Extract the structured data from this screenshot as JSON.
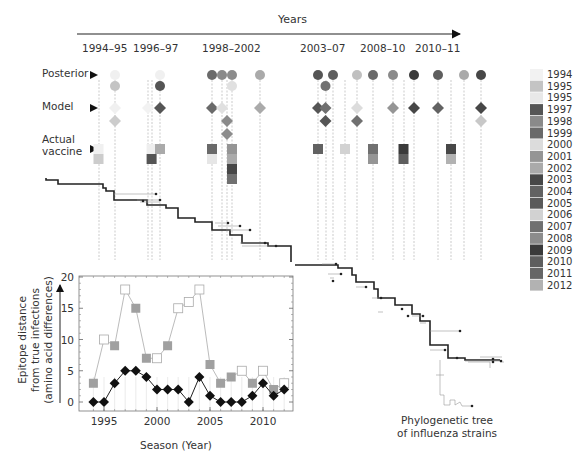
{
  "figure": {
    "years_label": "Years",
    "periods": [
      "1994–95",
      "1996–97",
      "1998–2002",
      "2003–07",
      "2008–10",
      "2010–11"
    ],
    "row_labels": {
      "posterior": "Posterior",
      "model": "Model",
      "actual1": "Actual",
      "actual2": "vaccine"
    },
    "tree_label1": "Phylogenetic tree",
    "tree_label2": "of influenza strains",
    "legend": [
      {
        "year": "1994",
        "color": "#f2f2f2"
      },
      {
        "year": "1995",
        "color": "#c4c4c4"
      },
      {
        "year": "1995",
        "color": "#e8e8e8"
      },
      {
        "year": "1997",
        "color": "#555555"
      },
      {
        "year": "1998",
        "color": "#8a8a8a"
      },
      {
        "year": "1999",
        "color": "#6a6a6a"
      },
      {
        "year": "2000",
        "color": "#dcdcdc"
      },
      {
        "year": "2001",
        "color": "#959595"
      },
      {
        "year": "2002",
        "color": "#aaaaaa"
      },
      {
        "year": "2003",
        "color": "#474747"
      },
      {
        "year": "2004",
        "color": "#626262"
      },
      {
        "year": "2005",
        "color": "#5a5a5a"
      },
      {
        "year": "2006",
        "color": "#d2d2d2"
      },
      {
        "year": "2007",
        "color": "#707070"
      },
      {
        "year": "2008",
        "color": "#8c8c8c"
      },
      {
        "year": "2009",
        "color": "#3a3a3a"
      },
      {
        "year": "2010",
        "color": "#5e5e5e"
      },
      {
        "year": "2011",
        "color": "#666666"
      },
      {
        "year": "2012",
        "color": "#b2b2b2"
      }
    ],
    "posterior_markers": [
      {
        "col": 0,
        "tier": 0,
        "color": "#f0f0f0"
      },
      {
        "col": 0,
        "tier": 1,
        "color": "#c4c4c4"
      },
      {
        "col": 2,
        "tier": 0,
        "color": "#f0f0f0"
      },
      {
        "col": 2,
        "tier": 1,
        "color": "#555555"
      },
      {
        "col": 3,
        "tier": 0,
        "color": "#6a6a6a"
      },
      {
        "col": 4,
        "tier": 0,
        "color": "#8a8a8a"
      },
      {
        "col": 5,
        "tier": 0,
        "color": "#8c8c8c"
      },
      {
        "col": 5,
        "tier": 1,
        "color": "#e0e0e0"
      },
      {
        "col": 6,
        "tier": 0,
        "color": "#aaaaaa"
      },
      {
        "col": 7,
        "tier": 0,
        "color": "#555555"
      },
      {
        "col": 8,
        "tier": 0,
        "color": "#5e5e5e"
      },
      {
        "col": 7.5,
        "tier": 1,
        "color": "#707070"
      },
      {
        "col": 9,
        "tier": 0,
        "color": "#c0c0c0"
      },
      {
        "col": 10,
        "tier": 0,
        "color": "#6a6a6a"
      },
      {
        "col": 11,
        "tier": 0,
        "color": "#8a8a8a"
      },
      {
        "col": 12,
        "tier": 0,
        "color": "#3a3a3a"
      },
      {
        "col": 13,
        "tier": 0,
        "color": "#5e5e5e"
      },
      {
        "col": 14,
        "tier": 0,
        "color": "#aaaaaa"
      },
      {
        "col": 15,
        "tier": 0,
        "color": "#474747"
      }
    ],
    "model_markers": [
      {
        "col": 0,
        "tier": 0,
        "color": "#f0f0f0"
      },
      {
        "col": 0,
        "tier": 1,
        "color": "#cccccc"
      },
      {
        "col": 1,
        "tier": 0,
        "color": "#f2f2f2"
      },
      {
        "col": 2,
        "tier": 0,
        "color": "#555555"
      },
      {
        "col": 3,
        "tier": 0,
        "color": "#6a6a6a"
      },
      {
        "col": 4,
        "tier": 0,
        "color": "#e0e0e0"
      },
      {
        "col": 4.5,
        "tier": 1,
        "color": "#8a8a8a"
      },
      {
        "col": 4.5,
        "tier": 2,
        "color": "#8c8c8c"
      },
      {
        "col": 6,
        "tier": 0,
        "color": "#aaaaaa"
      },
      {
        "col": 7,
        "tier": 0,
        "color": "#555555"
      },
      {
        "col": 7.5,
        "tier": 0,
        "color": "#707070"
      },
      {
        "col": 7.5,
        "tier": 1,
        "color": "#555555"
      },
      {
        "col": 9,
        "tier": 0,
        "color": "#dcdcdc"
      },
      {
        "col": 9,
        "tier": 1,
        "color": "#707070"
      },
      {
        "col": 11,
        "tier": 0,
        "color": "#959595"
      },
      {
        "col": 12,
        "tier": 0,
        "color": "#474747"
      },
      {
        "col": 13,
        "tier": 0,
        "color": "#626262"
      },
      {
        "col": 15,
        "tier": 0,
        "color": "#474747"
      },
      {
        "col": 15,
        "tier": 1,
        "color": "#c8c8c8"
      }
    ],
    "actual_markers": [
      {
        "col": -0.5,
        "tier": 0,
        "color": "#f0f0f0"
      },
      {
        "col": -0.5,
        "tier": 1,
        "color": "#cccccc"
      },
      {
        "col": 1.3,
        "tier": 0,
        "color": "#eeeeee"
      },
      {
        "col": 1.3,
        "tier": 1,
        "color": "#555555"
      },
      {
        "col": 2,
        "tier": 0,
        "color": "#aaaaaa"
      },
      {
        "col": 3,
        "tier": 0,
        "color": "#6a6a6a"
      },
      {
        "col": 3,
        "tier": 1,
        "color": "#e6e6e6"
      },
      {
        "col": 5,
        "tier": 0,
        "color": "#959595"
      },
      {
        "col": 5,
        "tier": 1,
        "color": "#aaaaaa"
      },
      {
        "col": 5,
        "tier": 2,
        "color": "#474747"
      },
      {
        "col": 5,
        "tier": 3,
        "color": "#707070"
      },
      {
        "col": 7,
        "tier": 0,
        "color": "#626262"
      },
      {
        "col": 8.5,
        "tier": 0,
        "color": "#d2d2d2"
      },
      {
        "col": 10,
        "tier": 0,
        "color": "#707070"
      },
      {
        "col": 10,
        "tier": 1,
        "color": "#959595"
      },
      {
        "col": 11.5,
        "tier": 0,
        "color": "#3a3a3a"
      },
      {
        "col": 11.5,
        "tier": 1,
        "color": "#5e5e5e"
      },
      {
        "col": 13.5,
        "tier": 0,
        "color": "#474747"
      },
      {
        "col": 13.5,
        "tier": 1,
        "color": "#b2b2b2"
      }
    ]
  },
  "chart_data": {
    "type": "line",
    "title": "",
    "xlabel": "Season (Year)",
    "ylabel_lines": [
      "Epitope distance",
      "from true infections",
      "(amino acid differences)"
    ],
    "xlim": [
      1993.5,
      2012.8
    ],
    "ylim": [
      -1,
      20
    ],
    "xticks": [
      1995,
      2000,
      2005,
      2010
    ],
    "yticks": [
      0,
      5,
      10,
      15,
      20
    ],
    "x": [
      1994,
      1995,
      1996,
      1997,
      1998,
      1999,
      2000,
      2001,
      2002,
      2003,
      2004,
      2005,
      2006,
      2007,
      2008,
      2009,
      2010,
      2011,
      2012
    ],
    "series": [
      {
        "name": "Actual vaccine",
        "marker": "square",
        "line_color": "#aaaaaa",
        "values": [
          3,
          10,
          9,
          18,
          15,
          7,
          7,
          9,
          15,
          16,
          18,
          6,
          3,
          4,
          5,
          3,
          5,
          2,
          3
        ],
        "fill": [
          "gray",
          "white",
          "gray",
          "white",
          "gray",
          "gray",
          "white",
          "gray",
          "white",
          "white",
          "white",
          "gray",
          "gray",
          "gray",
          "white",
          "gray",
          "white",
          "gray",
          "white"
        ]
      },
      {
        "name": "Model prediction",
        "marker": "diamond",
        "line_color": "#222222",
        "values": [
          0,
          0,
          3,
          5,
          5,
          4,
          2,
          2,
          2,
          0,
          4,
          1,
          0,
          0,
          0,
          1,
          3,
          1,
          2
        ]
      }
    ],
    "fill_colors": {
      "gray": "#a0a0a0",
      "white": "#ffffff"
    }
  }
}
